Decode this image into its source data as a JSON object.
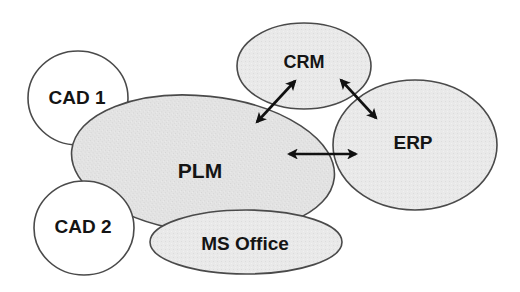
{
  "diagram": {
    "type": "system-integration",
    "colors": {
      "shaded_fill": "#e4e4e4",
      "white_fill": "#ffffff",
      "outline": "#4a4a4a",
      "text": "#141414",
      "arrow": "#111111"
    },
    "nodes": [
      {
        "id": "cad1",
        "label": "CAD 1",
        "cx": 78,
        "cy": 98,
        "rx": 50,
        "ry": 47,
        "fill": "white",
        "font_size": 19
      },
      {
        "id": "plm",
        "label": "PLM",
        "cx": 203,
        "cy": 164,
        "rx": 132,
        "ry": 68,
        "fill": "shaded",
        "font_size": 21
      },
      {
        "id": "cad2",
        "label": "CAD 2",
        "cx": 84,
        "cy": 228,
        "rx": 50,
        "ry": 47,
        "fill": "white",
        "font_size": 19
      },
      {
        "id": "msoffice",
        "label": "MS Office",
        "cx": 246,
        "cy": 242,
        "rx": 96,
        "ry": 32,
        "fill": "white",
        "font_size": 19
      },
      {
        "id": "crm",
        "label": "CRM",
        "cx": 304,
        "cy": 66,
        "rx": 67,
        "ry": 43,
        "fill": "shaded",
        "font_size": 18
      },
      {
        "id": "erp",
        "label": "ERP",
        "cx": 415,
        "cy": 145,
        "rx": 82,
        "ry": 65,
        "fill": "shaded",
        "font_size": 19
      }
    ],
    "label_positions": {
      "cad1": {
        "x": 77,
        "y": 97
      },
      "plm": {
        "x": 200,
        "y": 170
      },
      "cad2": {
        "x": 83,
        "y": 226
      },
      "msoffice": {
        "x": 245,
        "y": 243
      },
      "crm": {
        "x": 304,
        "y": 62
      },
      "erp": {
        "x": 413,
        "y": 142
      }
    },
    "edges": [
      {
        "from": "plm",
        "to": "crm",
        "x1": 257,
        "y1": 122,
        "x2": 295,
        "y2": 81,
        "bidirectional": true
      },
      {
        "from": "crm",
        "to": "erp",
        "x1": 341,
        "y1": 80,
        "x2": 376,
        "y2": 118,
        "bidirectional": true
      },
      {
        "from": "plm",
        "to": "erp",
        "x1": 289,
        "y1": 154,
        "x2": 356,
        "y2": 154,
        "bidirectional": true
      }
    ]
  }
}
